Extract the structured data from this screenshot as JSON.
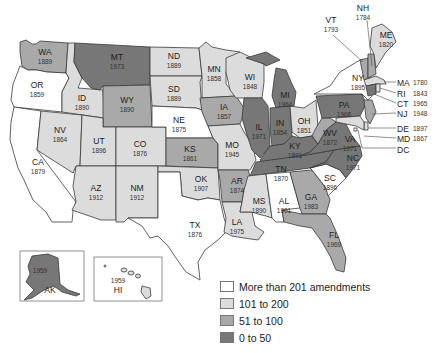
{
  "map": {
    "title": "",
    "colors": {
      "more_than_201": "#ffffff",
      "101_to_200": "#dcdcdc",
      "51_to_100": "#a9a9a9",
      "0_to_50": "#777777"
    },
    "states": {
      "WA": {
        "label": "WA",
        "year": "1889",
        "category": "51_to_100"
      },
      "OR": {
        "label": "OR",
        "year": "1859",
        "category": "more_than_201"
      },
      "CA": {
        "label": "CA",
        "year": "1879",
        "category": "more_than_201"
      },
      "ID": {
        "label": "ID",
        "year": "1890",
        "category": "101_to_200"
      },
      "NV": {
        "label": "NV",
        "year": "1864",
        "category": "101_to_200"
      },
      "MT": {
        "label": "MT",
        "year": "1973",
        "category": "0_to_50"
      },
      "WY": {
        "label": "WY",
        "year": "1890",
        "category": "51_to_100"
      },
      "UT": {
        "label": "UT",
        "year": "1896",
        "category": "101_to_200"
      },
      "AZ": {
        "label": "AZ",
        "year": "1912",
        "category": "101_to_200"
      },
      "CO": {
        "label": "CO",
        "year": "1876",
        "category": "101_to_200"
      },
      "NM": {
        "label": "NM",
        "year": "1912",
        "category": "101_to_200"
      },
      "ND": {
        "label": "ND",
        "year": "1889",
        "category": "101_to_200"
      },
      "SD": {
        "label": "SD",
        "year": "1889",
        "category": "101_to_200"
      },
      "NE": {
        "label": "NE",
        "year": "1875",
        "category": "more_than_201"
      },
      "KS": {
        "label": "KS",
        "year": "1861",
        "category": "51_to_100"
      },
      "OK": {
        "label": "OK",
        "year": "1907",
        "category": "101_to_200"
      },
      "TX": {
        "label": "TX",
        "year": "1876",
        "category": "more_than_201"
      },
      "MN": {
        "label": "MN",
        "year": "1858",
        "category": "101_to_200"
      },
      "IA": {
        "label": "IA",
        "year": "1857",
        "category": "51_to_100"
      },
      "MO": {
        "label": "MO",
        "year": "1945",
        "category": "101_to_200"
      },
      "AR": {
        "label": "AR",
        "year": "1874",
        "category": "51_to_100"
      },
      "LA": {
        "label": "LA",
        "year": "1975",
        "category": "101_to_200"
      },
      "WI": {
        "label": "WI",
        "year": "1848",
        "category": "101_to_200"
      },
      "IL": {
        "label": "IL",
        "year": "1971",
        "category": "0_to_50"
      },
      "MI": {
        "label": "MI",
        "year": "1964",
        "category": "0_to_50"
      },
      "IN": {
        "label": "IN",
        "year": "1854",
        "category": "0_to_50"
      },
      "OH": {
        "label": "OH",
        "year": "1851",
        "category": "101_to_200"
      },
      "KY": {
        "label": "KY",
        "year": "1891",
        "category": "0_to_50"
      },
      "TN": {
        "label": "TN",
        "year": "1870",
        "category": "0_to_50"
      },
      "MS": {
        "label": "MS",
        "year": "1890",
        "category": "101_to_200"
      },
      "AL": {
        "label": "AL",
        "year": "1901",
        "category": "more_than_201"
      },
      "GA": {
        "label": "GA",
        "year": "1983",
        "category": "51_to_100"
      },
      "FL": {
        "label": "FL",
        "year": "1969",
        "category": "51_to_100"
      },
      "SC": {
        "label": "SC",
        "year": "1896",
        "category": "more_than_201"
      },
      "NC": {
        "label": "NC",
        "year": "1971",
        "category": "0_to_50"
      },
      "VA": {
        "label": "VA",
        "year": "1971",
        "category": "0_to_50"
      },
      "WV": {
        "label": "WV",
        "year": "1872",
        "category": "51_to_100"
      },
      "PA": {
        "label": "PA",
        "year": "1968",
        "category": "0_to_50"
      },
      "NY": {
        "label": "NY",
        "year": "1895",
        "category": "more_than_201"
      },
      "VT": {
        "label": "VT",
        "year": "1793",
        "category": "51_to_100"
      },
      "NH": {
        "label": "NH",
        "year": "1784",
        "category": "51_to_100"
      },
      "ME": {
        "label": "ME",
        "year": "1820",
        "category": "101_to_200"
      },
      "MA": {
        "label": "MA",
        "year": "1780",
        "category": "101_to_200"
      },
      "RI": {
        "label": "RI",
        "year": "1843",
        "category": "101_to_200"
      },
      "CT": {
        "label": "CT",
        "year": "1965",
        "category": "0_to_50"
      },
      "NJ": {
        "label": "NJ",
        "year": "1948",
        "category": "51_to_100"
      },
      "DE": {
        "label": "DE",
        "year": "1897",
        "category": "101_to_200"
      },
      "MD": {
        "label": "MD",
        "year": "1867",
        "category": "101_to_200"
      },
      "DC": {
        "label": "DC",
        "year": "",
        "category": "more_than_201"
      },
      "AK": {
        "label": "AK",
        "year": "1959",
        "category": "0_to_50"
      },
      "HI": {
        "label": "HI",
        "year": "1959",
        "category": "101_to_200"
      }
    }
  },
  "legend": {
    "items": [
      {
        "label": "More than 201 amendments",
        "color": "#ffffff"
      },
      {
        "label": "101 to 200",
        "color": "#dcdcdc"
      },
      {
        "label": "51 to 100",
        "color": "#a9a9a9"
      },
      {
        "label": "0 to 50",
        "color": "#777777"
      }
    ]
  }
}
